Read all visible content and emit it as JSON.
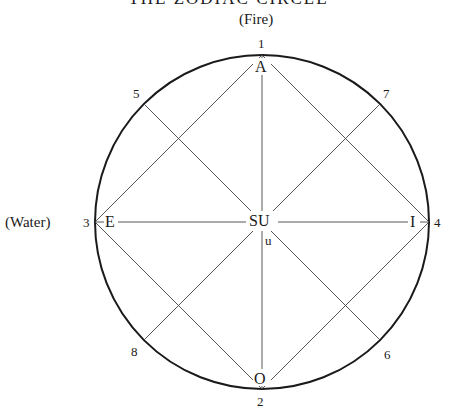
{
  "title": "THE ZODIAC CIRCLE",
  "elements": {
    "top": "(Fire)",
    "left": "(Water)"
  },
  "points": {
    "p1": "1",
    "p2": "2",
    "p3": "3",
    "p4": "4",
    "p5": "5",
    "p6": "6",
    "p7": "7",
    "p8": "8"
  },
  "vowels": {
    "top": "A",
    "bottom": "O",
    "left": "E",
    "right": "I",
    "center": "SU",
    "center_sub": "u"
  },
  "geometry": {
    "center": [
      262,
      222
    ],
    "radius": 167
  }
}
